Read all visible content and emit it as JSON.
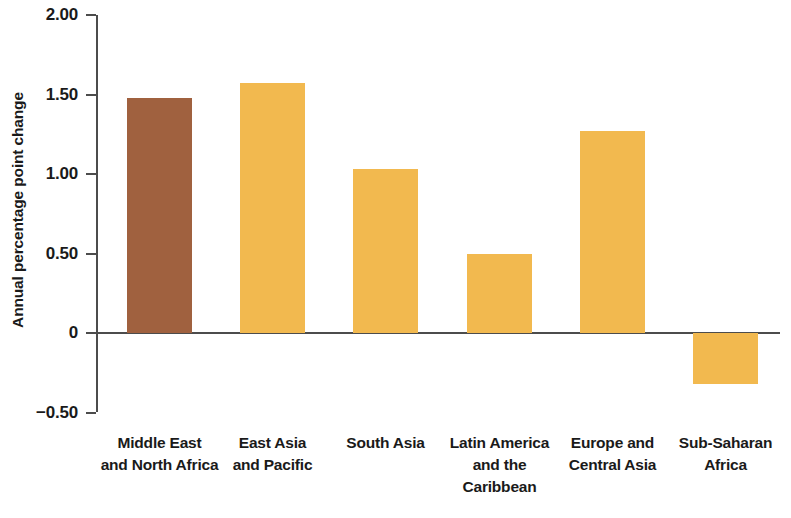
{
  "chart_data": {
    "type": "bar",
    "title": "",
    "subtitle": "",
    "xlabel": "",
    "ylabel": "Annual percentage point change",
    "ylim": [
      -0.5,
      2.0
    ],
    "yticks": [
      2.0,
      1.5,
      1.0,
      0.5,
      0,
      -0.5
    ],
    "ytick_labels": [
      "2.00",
      "1.50",
      "1.00",
      "0.50",
      "0",
      "−0.50"
    ],
    "grid": false,
    "legend": "none",
    "categories": [
      "Middle East and North Africa",
      "East Asia and Pacific",
      "South Asia",
      "Latin America and the Caribbean",
      "Europe and Central Asia",
      "Sub-Saharan Africa"
    ],
    "category_label_lines": [
      [
        "Middle East",
        "and North Africa"
      ],
      [
        "East Asia",
        "and Pacific"
      ],
      [
        "South Asia"
      ],
      [
        "Latin America",
        "and the",
        "Caribbean"
      ],
      [
        "Europe and",
        "Central Asia"
      ],
      [
        "Sub-Saharan",
        "Africa"
      ]
    ],
    "values": [
      1.48,
      1.57,
      1.03,
      0.5,
      1.27,
      -0.32
    ],
    "bar_colors": [
      "#a0613f",
      "#f2b94f",
      "#f2b94f",
      "#f2b94f",
      "#f2b94f",
      "#f2b94f"
    ]
  },
  "colors": {
    "highlight_bar": "#a0613f",
    "default_bar": "#f2b94f",
    "axis": "#4c4c4c",
    "text": "#1a1a1a",
    "background": "#ffffff"
  }
}
